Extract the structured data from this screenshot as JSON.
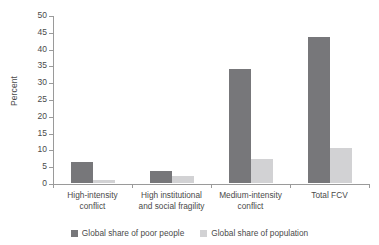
{
  "chart_data": {
    "type": "bar",
    "title": "",
    "subtitle": "",
    "xlabel": "",
    "ylabel": "Percent",
    "ylim": [
      0,
      50
    ],
    "ytick_step": 5,
    "yticks": [
      "50",
      "45",
      "40",
      "35",
      "30",
      "25",
      "20",
      "15",
      "10",
      "5",
      "0"
    ],
    "grid": false,
    "legend_position": "bottom-center",
    "categories": [
      "High-intensity conflict",
      "High institutional and social fragility",
      "Medium-intensity conflict",
      "Total FCV"
    ],
    "category_lines": [
      [
        "High-intensity",
        "conflict"
      ],
      [
        "High institutional",
        "and social fragility"
      ],
      [
        "Medium-intensity",
        "conflict"
      ],
      [
        "Total FCV"
      ]
    ],
    "series": [
      {
        "name": "Global share of poor people",
        "color": "#77777a",
        "values": [
          6.3,
          3.5,
          34.0,
          43.5
        ]
      },
      {
        "name": "Global share of population",
        "color": "#d2d2d4",
        "values": [
          1.0,
          2.0,
          7.0,
          10.5
        ]
      }
    ]
  },
  "axis": {
    "y_title": "Percent"
  },
  "legend": {
    "items": [
      {
        "label": "Global share of poor people",
        "color": "#77777a"
      },
      {
        "label": "Global share of population",
        "color": "#d2d2d4"
      }
    ]
  }
}
